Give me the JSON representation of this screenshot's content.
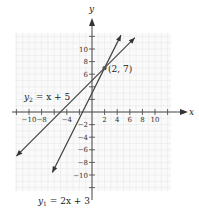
{
  "chart_data": {
    "type": "line",
    "title": "",
    "xlabel": "x",
    "ylabel": "y",
    "xlim": [
      -12,
      12
    ],
    "ylim": [
      -12,
      12
    ],
    "grid": true,
    "x_tick_labels": [
      "-10",
      "-8",
      "-4",
      "2",
      "4",
      "6",
      "8",
      "10"
    ],
    "y_tick_labels": [
      "10",
      "8",
      "6",
      "-2",
      "-4",
      "-6",
      "-8",
      "-10"
    ],
    "series": [
      {
        "name": "y1 = 2x + 3",
        "label_main": "y",
        "label_sub": "1",
        "label_rest": " = 2x + 3",
        "slope": 2,
        "intercept": 3,
        "x": [
          -6.3,
          4.6
        ],
        "y": [
          -9.6,
          12.2
        ]
      },
      {
        "name": "y2 = x + 5",
        "label_main": "y",
        "label_sub": "2",
        "label_rest": " = x + 5",
        "slope": 1,
        "intercept": 5,
        "x": [
          -12,
          6.8
        ],
        "y": [
          -7,
          11.8
        ]
      }
    ],
    "annotations": [
      {
        "text": "(2, 7)",
        "x": 2,
        "y": 7
      }
    ]
  }
}
